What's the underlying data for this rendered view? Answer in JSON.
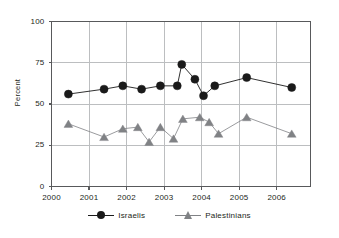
{
  "chart_data": {
    "type": "line",
    "title": "",
    "xlabel": "",
    "ylabel": "Percent",
    "xlim": [
      2000,
      2006.9
    ],
    "ylim": [
      0,
      100
    ],
    "grid": true,
    "legend_position": "bottom",
    "y_ticks": [
      0,
      25,
      50,
      75,
      100
    ],
    "y_tick_labels": [
      "0",
      "25",
      "50",
      "75",
      "100"
    ],
    "x_ticks": [
      2000,
      2001,
      2002,
      2003,
      2004,
      2005,
      2006
    ],
    "x_tick_labels": [
      "2000",
      "2001",
      "2002",
      "2003",
      "2004",
      "2005",
      "2006"
    ],
    "series": [
      {
        "name": "Israelis",
        "marker": "circle",
        "color": "#1a1a1a",
        "x": [
          2000.45,
          2001.4,
          2001.9,
          2002.4,
          2002.9,
          2003.35,
          2003.47,
          2003.82,
          2004.05,
          2004.35,
          2005.2,
          2006.4
        ],
        "values": [
          56,
          59,
          61,
          59,
          61,
          61,
          74,
          65,
          55,
          61,
          66,
          60
        ]
      },
      {
        "name": "Palestinians",
        "marker": "triangle",
        "color": "#808285",
        "x": [
          2000.45,
          2001.4,
          2001.9,
          2002.3,
          2002.6,
          2002.9,
          2003.25,
          2003.5,
          2003.95,
          2004.2,
          2004.45,
          2005.2,
          2006.4
        ],
        "values": [
          38,
          30,
          35,
          36,
          27,
          36,
          29,
          41,
          42,
          39,
          32,
          42,
          32
        ]
      }
    ]
  },
  "legend": {
    "entries": [
      {
        "label": "Israelis",
        "marker": "circle-marker-icon",
        "color": "#1a1a1a"
      },
      {
        "label": "Palestinians",
        "marker": "triangle-marker-icon",
        "color": "#808285"
      }
    ]
  },
  "colors": {
    "israelis": "#1a1a1a",
    "palestinians": "#808285",
    "grid": "#bcbec0",
    "axis": "#58595b",
    "text": "#231f20",
    "background": "#ffffff"
  }
}
